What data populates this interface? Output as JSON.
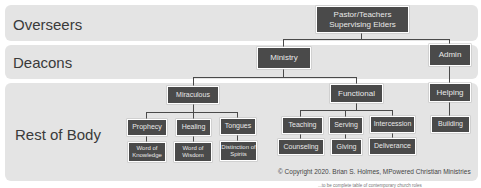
{
  "bands": [
    {
      "label": "Overseers"
    },
    {
      "label": "Deacons"
    },
    {
      "label": "Rest of Body"
    }
  ],
  "nodes": {
    "pastor": "Pastor/Teachers Supervising Elders",
    "pastor_line1": "Pastor/Teachers",
    "pastor_line2": "Supervising Elders",
    "ministry": "Ministry",
    "admin": "Admin",
    "miraculous": "Miraculous",
    "functional": "Functional",
    "helping": "Helping",
    "prophecy": "Prophecy",
    "healing": "Healing",
    "tongues": "Tongues",
    "word_of_knowledge": "Word of Knowledge",
    "word_of_wisdom": "Word of Wisdom",
    "distinction_of_spirits": "Distinction of Spirits",
    "teaching": "Teaching",
    "serving": "Serving",
    "intercession": "Intercession",
    "counseling": "Counseling",
    "giving": "Giving",
    "deliverance": "Deliverance",
    "building": "Building"
  },
  "copyright": "© Copyright 2020. Brian S. Holmes, MPowered Christian Ministries",
  "footnote": "...to be complete table of contemporary church roles"
}
